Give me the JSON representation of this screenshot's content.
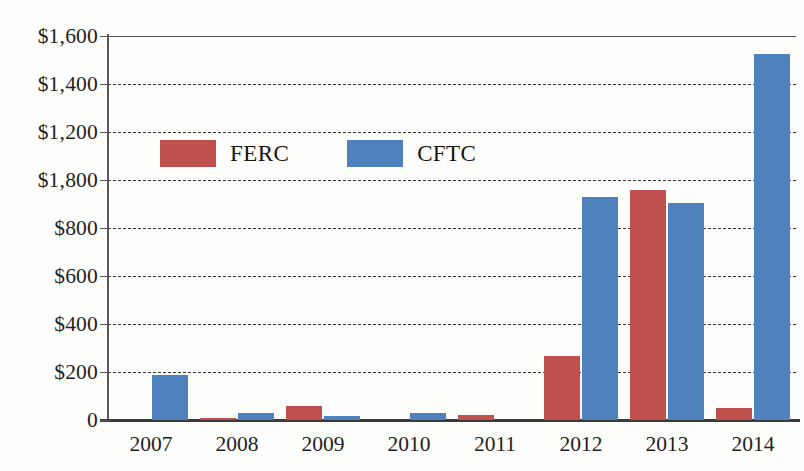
{
  "chart_data": {
    "type": "bar",
    "title": "",
    "xlabel": "",
    "ylabel": "",
    "categories": [
      "2007",
      "2008",
      "2009",
      "2010",
      "2011",
      "2012",
      "2013",
      "2014"
    ],
    "series": [
      {
        "name": "FERC",
        "color": "#c0504d",
        "values": [
          0,
          5,
          58,
          0,
          22,
          268,
          960,
          50
        ]
      },
      {
        "name": "CFTC",
        "color": "#4f81bd",
        "values": [
          188,
          28,
          15,
          30,
          0,
          930,
          905,
          1525
        ]
      }
    ],
    "ylim": [
      0,
      1600
    ],
    "ytick_values": [
      0,
      200,
      400,
      600,
      800,
      1000,
      1200,
      1400,
      1600
    ],
    "ytick_labels": [
      "0",
      "$200",
      "$400",
      "$600",
      "$800",
      "$1,800",
      "$1,200",
      "$1,400",
      "$1,600"
    ],
    "grid": true,
    "grid_style": "dashed",
    "legend_position": "upper-left-inside",
    "legend": [
      "FERC",
      "CFTC"
    ]
  },
  "legend": {
    "entries": [
      {
        "label": "FERC",
        "swatch_name": "legend-swatch-ferc",
        "color": "#c0504d"
      },
      {
        "label": "CFTC",
        "swatch_name": "legend-swatch-cftc",
        "color": "#4f81bd"
      }
    ]
  }
}
